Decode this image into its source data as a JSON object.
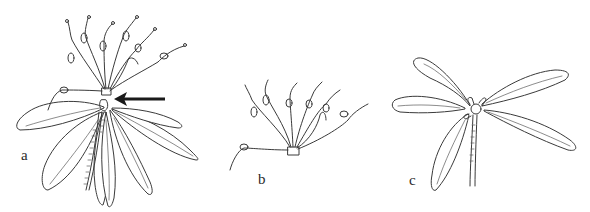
{
  "figure": {
    "type": "botanical line drawing",
    "background": "#ffffff",
    "ink_color": "#3a3a3a",
    "panels": [
      {
        "id": "a",
        "label": "a",
        "description": "Whole shoot with umbel-like cluster of flower stalks above a rosette of leaves; arrow points to node below the inflorescence",
        "has_arrow": true,
        "arrow_direction": "left"
      },
      {
        "id": "b",
        "label": "b",
        "description": "Detached cluster of flower stalks radiating from a small base"
      },
      {
        "id": "c",
        "label": "c",
        "description": "Shoot apex with five spreading leaves and a bud at the center"
      }
    ]
  }
}
